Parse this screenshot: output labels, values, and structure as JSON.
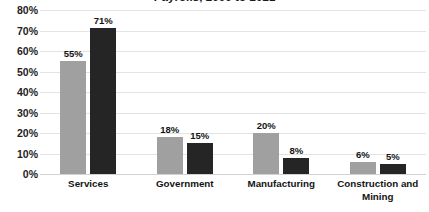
{
  "chart_data": {
    "type": "bar",
    "title": "Payrolls, 2000 to 2021",
    "xlabel": "",
    "ylabel": "",
    "ylim": [
      0,
      80
    ],
    "ytick_labels": [
      "80%",
      "70%",
      "60%",
      "50%",
      "40%",
      "30%",
      "20%",
      "10%",
      "0%"
    ],
    "ytick_values": [
      80,
      70,
      60,
      50,
      40,
      30,
      20,
      10,
      0
    ],
    "grid": true,
    "legend": "none",
    "categories": [
      "Services",
      "Government",
      "Manufacturing",
      "Construction and Mining"
    ],
    "series": [
      {
        "name": "series-a",
        "color": "#a0a0a0",
        "values": [
          55,
          18,
          20,
          6
        ],
        "labels": [
          "55%",
          "18%",
          "20%",
          "6%"
        ]
      },
      {
        "name": "series-b",
        "color": "#252525",
        "values": [
          71,
          15,
          8,
          5
        ],
        "labels": [
          "71%",
          "15%",
          "8%",
          "5%"
        ]
      }
    ]
  }
}
